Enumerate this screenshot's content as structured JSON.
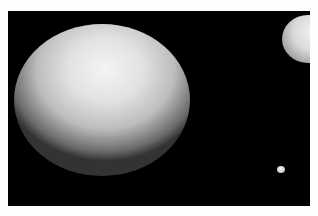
{
  "scene": {
    "description": "Rendered white spheres on black background",
    "background_color": "#000000",
    "border_color": "#fdfdfd",
    "objects": [
      {
        "name": "large-sphere",
        "color": "#e8e8e8"
      },
      {
        "name": "right-clipped-sphere",
        "color": "#e0e0e0"
      },
      {
        "name": "small-sphere",
        "color": "#e6e6e6"
      }
    ]
  }
}
